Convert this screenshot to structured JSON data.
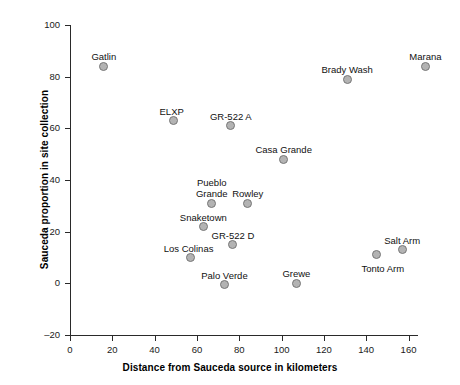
{
  "chart_data": {
    "type": "scatter",
    "title": "",
    "xlabel": "Distance from Sauceda source in kilometers",
    "ylabel": "Sauceda proportion in site collection",
    "xlim": [
      0,
      164
    ],
    "ylim": [
      -20,
      100
    ],
    "xticks": [
      0,
      20,
      40,
      60,
      80,
      100,
      120,
      140,
      160
    ],
    "yticks": [
      -20,
      0,
      20,
      40,
      60,
      80,
      100
    ],
    "grid": false,
    "legend": "none",
    "marker_fill": "#b3b3b3",
    "marker_edge": "#777777",
    "points": [
      {
        "label": "Gatlin",
        "x": 16,
        "y": 84,
        "label_dx": 0,
        "label_dy": -15,
        "align": "center"
      },
      {
        "label": "ELXP",
        "x": 49,
        "y": 63,
        "label_dx": -2,
        "label_dy": -15,
        "align": "center"
      },
      {
        "label": "GR-522 A",
        "x": 76,
        "y": 61,
        "label_dx": 0,
        "label_dy": -15,
        "align": "center"
      },
      {
        "label": "Casa Grande",
        "x": 101,
        "y": 48,
        "label_dx": 0,
        "label_dy": -15,
        "align": "center"
      },
      {
        "label": "Brady Wash",
        "x": 131,
        "y": 79,
        "label_dx": 0,
        "label_dy": -15,
        "align": "center"
      },
      {
        "label": "Marana",
        "x": 168,
        "y": 84,
        "label_dx": 0,
        "label_dy": -15,
        "align": "center"
      },
      {
        "label": "Pueblo\nGrande",
        "x": 67,
        "y": 31,
        "label_dx": 0,
        "label_dy": -26,
        "align": "center"
      },
      {
        "label": "Rowley",
        "x": 84,
        "y": 31,
        "label_dx": 0,
        "label_dy": -15,
        "align": "center"
      },
      {
        "label": "Snaketown",
        "x": 63,
        "y": 22,
        "label_dx": 0,
        "label_dy": -15,
        "align": "center"
      },
      {
        "label": "GR-522 D",
        "x": 77,
        "y": 15,
        "label_dx": 0,
        "label_dy": -15,
        "align": "center"
      },
      {
        "label": "Los Colinas",
        "x": 57,
        "y": 10,
        "label_dx": -2,
        "label_dy": -15,
        "align": "center"
      },
      {
        "label": "Palo Verde",
        "x": 73,
        "y": -0.5,
        "label_dx": 0,
        "label_dy": -15,
        "align": "center"
      },
      {
        "label": "Grewe",
        "x": 107,
        "y": 0,
        "label_dx": 0,
        "label_dy": -15,
        "align": "center"
      },
      {
        "label": "Salt Arm",
        "x": 157,
        "y": 13,
        "label_dx": 0,
        "label_dy": -15,
        "align": "center"
      },
      {
        "label": "Tonto Arm",
        "x": 145,
        "y": 11,
        "label_dx": 6,
        "label_dy": 8,
        "align": "center"
      }
    ]
  }
}
